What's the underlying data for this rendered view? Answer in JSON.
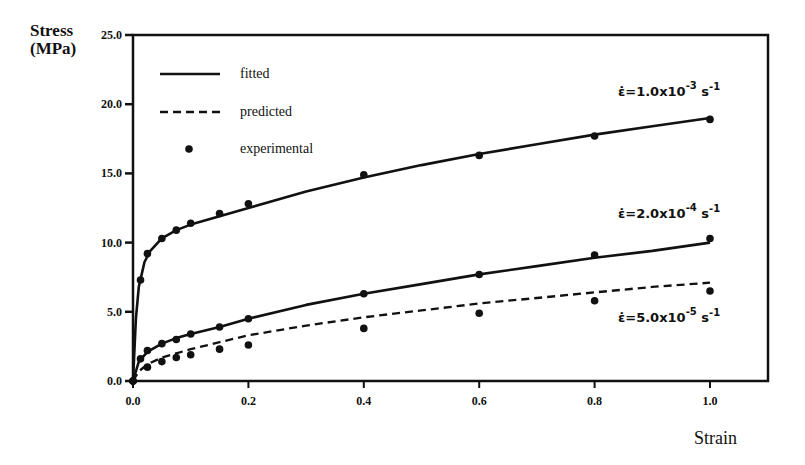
{
  "chart_data": {
    "type": "line",
    "title": "",
    "xlabel": "Strain",
    "ylabel": "Stress (MPa)",
    "xlim": [
      0,
      1.0
    ],
    "ylim": [
      0,
      25.0
    ],
    "xticks": [
      "0.0",
      "0.2",
      "0.4",
      "0.6",
      "0.8",
      "1.0"
    ],
    "yticks": [
      "0.0",
      "5.0",
      "10.0",
      "15.0",
      "20.0",
      "25.0"
    ],
    "grid": false,
    "legend": {
      "position": "upper-left",
      "entries": [
        {
          "label": "fitted",
          "style": "solid-line"
        },
        {
          "label": "predicted",
          "style": "dashed-line"
        },
        {
          "label": "experimental",
          "style": "dot-marker"
        }
      ]
    },
    "series": [
      {
        "name": "strain rate 1.0x10^-3 s^-1",
        "annotation": "ε̇=1.0x10⁻³ s⁻¹",
        "curve": "fitted",
        "experimental": {
          "x": [
            0.0,
            0.013,
            0.025,
            0.05,
            0.075,
            0.1,
            0.15,
            0.2,
            0.4,
            0.6,
            0.8,
            1.0
          ],
          "y": [
            0.0,
            7.3,
            9.2,
            10.3,
            10.9,
            11.4,
            12.1,
            12.8,
            14.9,
            16.3,
            17.7,
            18.9
          ]
        },
        "fit": {
          "x": [
            0.0,
            0.005,
            0.01,
            0.02,
            0.03,
            0.05,
            0.075,
            0.1,
            0.15,
            0.2,
            0.3,
            0.4,
            0.5,
            0.6,
            0.7,
            0.8,
            0.9,
            1.0
          ],
          "y": [
            0.0,
            4.5,
            6.8,
            8.6,
            9.4,
            10.3,
            10.9,
            11.3,
            11.9,
            12.5,
            13.7,
            14.7,
            15.6,
            16.4,
            17.1,
            17.8,
            18.4,
            19.0
          ]
        }
      },
      {
        "name": "strain rate 2.0x10^-4 s^-1",
        "annotation": "ε̇=2.0x10⁻⁴ s⁻¹",
        "curve": "fitted",
        "experimental": {
          "x": [
            0.0,
            0.013,
            0.025,
            0.05,
            0.075,
            0.1,
            0.15,
            0.2,
            0.4,
            0.6,
            0.8,
            1.0
          ],
          "y": [
            0.0,
            1.6,
            2.2,
            2.7,
            3.0,
            3.4,
            3.9,
            4.5,
            6.3,
            7.7,
            9.1,
            10.3
          ]
        },
        "fit": {
          "x": [
            0.0,
            0.01,
            0.025,
            0.05,
            0.075,
            0.1,
            0.15,
            0.2,
            0.3,
            0.4,
            0.5,
            0.6,
            0.7,
            0.8,
            0.9,
            1.0
          ],
          "y": [
            0.0,
            1.4,
            2.1,
            2.7,
            3.1,
            3.4,
            3.9,
            4.5,
            5.5,
            6.3,
            7.0,
            7.7,
            8.3,
            8.9,
            9.4,
            10.0
          ]
        }
      },
      {
        "name": "strain rate 5.0x10^-5 s^-1",
        "annotation": "ε̇=5.0x10⁻⁵ s⁻¹",
        "curve": "predicted",
        "experimental": {
          "x": [
            0.0,
            0.025,
            0.05,
            0.075,
            0.1,
            0.15,
            0.2,
            0.4,
            0.6,
            0.8,
            1.0
          ],
          "y": [
            0.0,
            1.0,
            1.4,
            1.7,
            1.9,
            2.3,
            2.6,
            3.8,
            4.9,
            5.8,
            6.5
          ]
        },
        "fit": {
          "x": [
            0.0,
            0.01,
            0.025,
            0.05,
            0.075,
            0.1,
            0.15,
            0.2,
            0.3,
            0.4,
            0.5,
            0.6,
            0.7,
            0.8,
            0.9,
            1.0
          ],
          "y": [
            0.0,
            0.7,
            1.2,
            1.7,
            2.0,
            2.3,
            2.8,
            3.3,
            4.0,
            4.6,
            5.1,
            5.6,
            6.0,
            6.4,
            6.8,
            7.1
          ]
        }
      }
    ]
  },
  "labels": {
    "ylabel_line1": "Stress",
    "ylabel_line2": "(MPa)",
    "xlabel": "Strain"
  }
}
